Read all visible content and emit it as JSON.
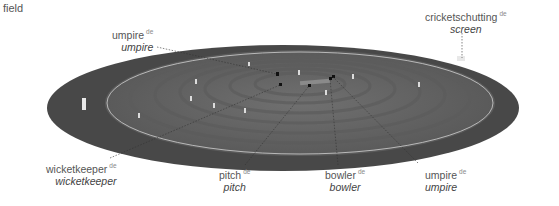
{
  "title": "field",
  "labels": [
    {
      "id": "umpire-top",
      "term": "umpire",
      "lang": "de",
      "translation": "umpire"
    },
    {
      "id": "screen",
      "term": "cricketschutting",
      "lang": "de",
      "translation": "screen"
    },
    {
      "id": "wicketkeeper",
      "term": "wicketkeeper",
      "lang": "de",
      "translation": "wicketkeeper"
    },
    {
      "id": "pitch",
      "term": "pitch",
      "lang": "de",
      "translation": "pitch"
    },
    {
      "id": "bowler",
      "term": "bowler",
      "lang": "de",
      "translation": "bowler"
    },
    {
      "id": "umpire-bottom",
      "term": "umpire",
      "lang": "de",
      "translation": "umpire"
    }
  ],
  "colors": {
    "outfield": "#4a4a4a",
    "field": "#6b6b6b",
    "stripe": "#5e5e5e",
    "boundary_line": "#d8d8d8",
    "text": "#555555"
  }
}
